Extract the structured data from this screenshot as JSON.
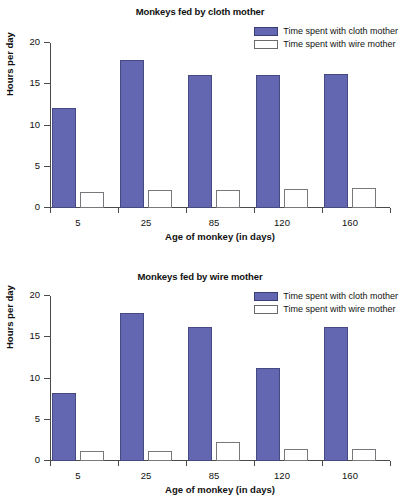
{
  "chart_data": [
    {
      "type": "bar",
      "title": "Monkeys fed by cloth mother",
      "xlabel": "Age of monkey (in days)",
      "ylabel": "Hours per day",
      "categories": [
        "5",
        "25",
        "85",
        "120",
        "160"
      ],
      "ylim": [
        0,
        20
      ],
      "yticks": [
        "0",
        "5",
        "10",
        "15",
        "20"
      ],
      "grid": false,
      "legend_position": "top-right",
      "series": [
        {
          "name": "Time spent with cloth mother",
          "color": "#6366b0",
          "values": [
            12.1,
            18.0,
            16.1,
            16.1,
            16.2
          ]
        },
        {
          "name": "Time spent with wire mother",
          "color": "#ffffff",
          "values": [
            2.0,
            2.2,
            2.2,
            2.25,
            2.4
          ]
        }
      ]
    },
    {
      "type": "bar",
      "title": "Monkeys fed by wire mother",
      "xlabel": "Age of monkey (in days)",
      "ylabel": "Hours per day",
      "categories": [
        "5",
        "25",
        "85",
        "120",
        "160"
      ],
      "ylim": [
        0,
        20
      ],
      "yticks": [
        "0",
        "5",
        "10",
        "15",
        "20"
      ],
      "grid": false,
      "legend_position": "top-right",
      "series": [
        {
          "name": "Time spent with cloth mother",
          "color": "#6366b0",
          "values": [
            8.3,
            18.0,
            16.2,
            11.3,
            16.3
          ]
        },
        {
          "name": "Time spent with wire mother",
          "color": "#ffffff",
          "values": [
            1.25,
            1.2,
            2.3,
            1.5,
            1.4
          ]
        }
      ]
    }
  ]
}
